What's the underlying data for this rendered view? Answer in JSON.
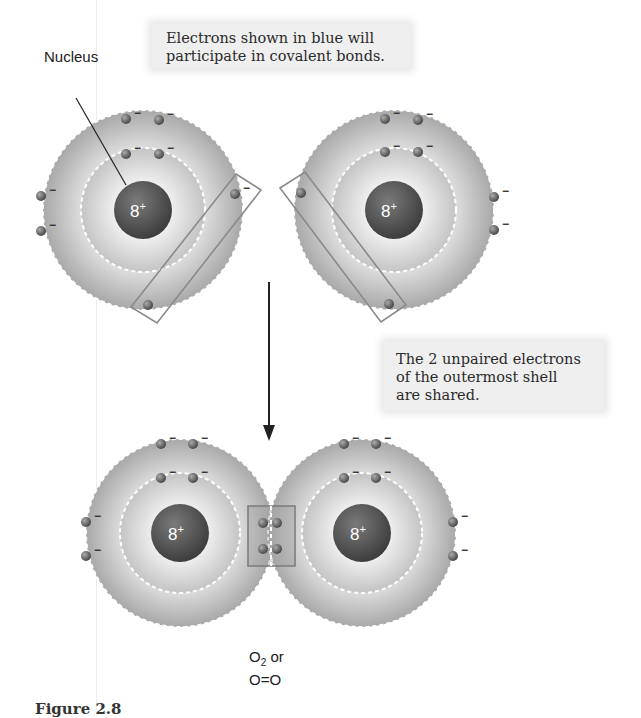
{
  "callouts": {
    "top": {
      "line1": "Electrons shown in blue will",
      "line2": "participate in covalent bonds."
    },
    "right": {
      "line1": "The 2 unpaired electrons",
      "line2": "of the outermost shell",
      "line3": "are shared."
    }
  },
  "labels": {
    "nucleus": "Nucleus",
    "formula_line1_base": "O",
    "formula_line1_sub": "2",
    "formula_line1_rest": " or",
    "formula_line2": "O=O"
  },
  "atoms": {
    "top_left": {
      "nucleus_charge": "8",
      "nucleus_sign": "+"
    },
    "top_right": {
      "nucleus_charge": "8",
      "nucleus_sign": "+"
    },
    "bottom_left": {
      "nucleus_charge": "8",
      "nucleus_sign": "+"
    },
    "bottom_right": {
      "nucleus_charge": "8",
      "nucleus_sign": "+"
    }
  },
  "electron_charge": "−",
  "caption": "Figure 2.8",
  "colors": {
    "outer_shell": "#b8b8b8",
    "inner_shell": "#d6d6d6",
    "nucleus": "#5a5a5a",
    "electron": "#6a6a6a",
    "highlight_box": "#8a8a8a",
    "callout_bg": "#efefef"
  }
}
